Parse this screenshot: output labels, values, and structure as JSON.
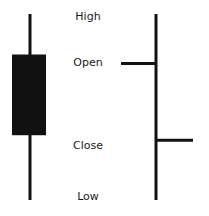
{
  "labels": {
    "high": "High",
    "open": "Open",
    "close": "Close",
    "low": "Low"
  },
  "price_levels": {
    "high": 4,
    "open": 3,
    "close": 1.35,
    "low": 0
  },
  "candlestick": {
    "direction": "bearish",
    "body_color": "#111111",
    "wick_color": "#111111"
  },
  "ohlc_bar": {
    "open_tick_side": "left",
    "close_tick_side": "right",
    "line_color": "#111111"
  }
}
